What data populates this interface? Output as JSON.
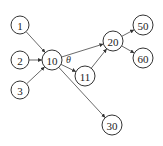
{
  "diagram": {
    "type": "directed-graph",
    "nodes": [
      {
        "id": "1",
        "label": "1",
        "x": 20,
        "y": 25,
        "r": 9
      },
      {
        "id": "2",
        "label": "2",
        "x": 20,
        "y": 60,
        "r": 9
      },
      {
        "id": "3",
        "label": "3",
        "x": 20,
        "y": 90,
        "r": 9
      },
      {
        "id": "10",
        "label": "10",
        "x": 52,
        "y": 60,
        "r": 10
      },
      {
        "id": "11",
        "label": "11",
        "x": 85,
        "y": 76,
        "r": 10
      },
      {
        "id": "20",
        "label": "20",
        "x": 113,
        "y": 41,
        "r": 10
      },
      {
        "id": "50",
        "label": "50",
        "x": 143,
        "y": 25,
        "r": 10
      },
      {
        "id": "60",
        "label": "60",
        "x": 143,
        "y": 58,
        "r": 10
      },
      {
        "id": "30",
        "label": "30",
        "x": 112,
        "y": 125,
        "r": 10
      }
    ],
    "edges": [
      {
        "from": "1",
        "to": "10"
      },
      {
        "from": "2",
        "to": "10"
      },
      {
        "from": "3",
        "to": "10"
      },
      {
        "from": "10",
        "to": "20"
      },
      {
        "from": "10",
        "to": "11",
        "label": "θ"
      },
      {
        "from": "10",
        "to": "30"
      },
      {
        "from": "11",
        "to": "20"
      },
      {
        "from": "20",
        "to": "50"
      },
      {
        "from": "20",
        "to": "60"
      }
    ],
    "edge_label": {
      "text": "θ",
      "x": 66,
      "y": 63
    }
  }
}
